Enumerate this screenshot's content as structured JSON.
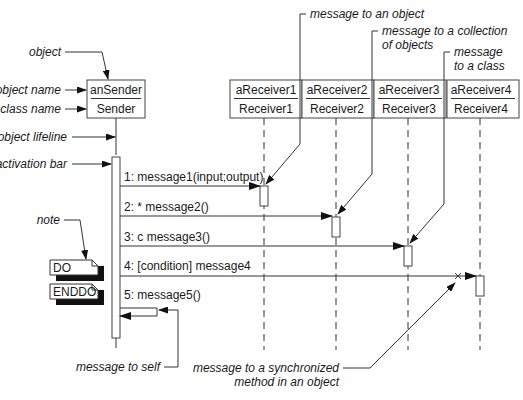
{
  "diagram": {
    "type": "UML sequence diagram",
    "objects": [
      {
        "object_name": "anSender",
        "class_name": "Sender"
      },
      {
        "object_name": "aReceiver1",
        "class_name": "Receiver1"
      },
      {
        "object_name": "aReceiver2",
        "class_name": "Receiver2"
      },
      {
        "object_name": "aReceiver3",
        "class_name": "Receiver3"
      },
      {
        "object_name": "aReceiver4",
        "class_name": "Receiver4"
      }
    ],
    "messages": [
      {
        "label": "1: message1(input;output)",
        "from": "anSender",
        "to": "aReceiver1"
      },
      {
        "label": "2: * message2()",
        "from": "anSender",
        "to": "aReceiver2"
      },
      {
        "label": "3: c message3()",
        "from": "anSender",
        "to": "aReceiver3"
      },
      {
        "label": "4: [condition] message4",
        "from": "anSender",
        "to": "aReceiver4"
      },
      {
        "label": "5: message5()",
        "from": "anSender",
        "to": "anSender"
      }
    ],
    "notes": [
      {
        "text": "DO"
      },
      {
        "text": "ENDDO"
      }
    ],
    "annotations": {
      "object": "object",
      "object_name": "object name",
      "class_name": "class name",
      "object_lifeline": "object lifeline",
      "activation_bar": "activation bar",
      "note": "note",
      "message_to_self": "message to self",
      "message_to_object": "message to an object",
      "message_to_collection_1": "message to a collection",
      "message_to_collection_2": "of objects",
      "message_to_class_1": "message",
      "message_to_class_2": "to a class",
      "sync_1": "message to a synchronized",
      "sync_2": "method in an object"
    }
  }
}
